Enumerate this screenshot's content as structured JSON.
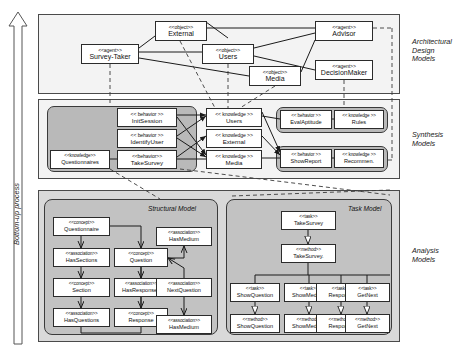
{
  "process_label": "Bottom-up process",
  "side_captions": [
    {
      "text": "Architectural\nDesign\nModels",
      "x": 412,
      "y": 38
    },
    {
      "text": "Synthesis\nModels",
      "x": 412,
      "y": 131
    },
    {
      "text": "Analysis\nModels",
      "x": 412,
      "y": 247
    }
  ],
  "layers": [
    {
      "name": "architectural-design-models",
      "x": 38,
      "y": 14,
      "w": 362,
      "h": 80
    },
    {
      "name": "synthesis-models",
      "x": 38,
      "y": 99,
      "w": 362,
      "h": 80
    },
    {
      "name": "analysis-models",
      "x": 38,
      "y": 190,
      "w": 362,
      "h": 152
    }
  ],
  "groups": [
    {
      "name": "synthesis-group-left",
      "x": 47,
      "y": 106,
      "w": 150,
      "h": 66
    },
    {
      "name": "synthesis-group-eval",
      "x": 276,
      "y": 107,
      "w": 112,
      "h": 26
    },
    {
      "name": "synthesis-group-report",
      "x": 276,
      "y": 146,
      "w": 112,
      "h": 26
    }
  ],
  "submodels": [
    {
      "name": "structural-model",
      "title": "Structural Model",
      "x": 44,
      "y": 199,
      "w": 174,
      "h": 136,
      "title_x": 148,
      "title_y": 205
    },
    {
      "name": "task-model",
      "title": "Task Model",
      "x": 226,
      "y": 199,
      "w": 166,
      "h": 136,
      "title_x": 348,
      "title_y": 205
    }
  ],
  "architectural_nodes": [
    {
      "name": "node-external",
      "stereotype": "<<object>>",
      "label": "External",
      "x": 155,
      "y": 21,
      "w": 52,
      "h": 20
    },
    {
      "name": "node-survey-taker",
      "stereotype": "<<agent>>",
      "label": "Survey-Taker",
      "x": 81,
      "y": 44,
      "w": 58,
      "h": 20
    },
    {
      "name": "node-users",
      "stereotype": "<<object>>",
      "label": "Users",
      "x": 202,
      "y": 44,
      "w": 52,
      "h": 20
    },
    {
      "name": "node-media",
      "stereotype": "<<object>>",
      "label": "Media",
      "x": 249,
      "y": 66,
      "w": 52,
      "h": 20
    },
    {
      "name": "node-advisor",
      "stereotype": "<<agent>>",
      "label": "Advisor",
      "x": 315,
      "y": 21,
      "w": 58,
      "h": 20
    },
    {
      "name": "node-decisionmaker",
      "stereotype": "<<agent>>",
      "label": "DecisionMaker",
      "x": 315,
      "y": 60,
      "w": 58,
      "h": 20
    }
  ],
  "synthesis_nodes": [
    {
      "name": "node-questionnaires",
      "stereotype": "<<knowledge>>",
      "label": "Questionnaires",
      "x": 50,
      "y": 150,
      "w": 60,
      "h": 19,
      "size": "tiny"
    },
    {
      "name": "node-initsession",
      "stereotype": "<< behavior >>",
      "label": "InitSession",
      "x": 117,
      "y": 108,
      "w": 60,
      "h": 19,
      "size": "small"
    },
    {
      "name": "node-identifyuser",
      "stereotype": "<< behavior >>",
      "label": "IdentifyUser",
      "x": 117,
      "y": 129,
      "w": 60,
      "h": 19,
      "size": "small"
    },
    {
      "name": "node-takesurvey-b",
      "stereotype": "<<behavior>>",
      "label": "TakeSurvey",
      "x": 117,
      "y": 150,
      "w": 60,
      "h": 19,
      "size": "small"
    },
    {
      "name": "node-k-users",
      "stereotype": "<< knowledge >>",
      "label": "Users",
      "x": 206,
      "y": 108,
      "w": 56,
      "h": 19,
      "size": "small"
    },
    {
      "name": "node-k-external",
      "stereotype": "<< knowledge >>",
      "label": "External",
      "x": 206,
      "y": 129,
      "w": 56,
      "h": 19,
      "size": "small"
    },
    {
      "name": "node-k-media",
      "stereotype": "<< knowledge >>",
      "label": "Media",
      "x": 206,
      "y": 150,
      "w": 56,
      "h": 19,
      "size": "small"
    },
    {
      "name": "node-evalaptitude",
      "stereotype": "<< behavior >>",
      "label": "EvalAptitude",
      "x": 280,
      "y": 110,
      "w": 52,
      "h": 19,
      "size": "tiny"
    },
    {
      "name": "node-rules",
      "stereotype": "<< knowledge >>",
      "label": "Rules",
      "x": 334,
      "y": 110,
      "w": 50,
      "h": 19,
      "size": "tiny"
    },
    {
      "name": "node-showreport",
      "stereotype": "<< behavior >>",
      "label": "ShowReport",
      "x": 280,
      "y": 149,
      "w": 52,
      "h": 19,
      "size": "tiny"
    },
    {
      "name": "node-recommen",
      "stereotype": "<< knowledge >>",
      "label": "Recommen.",
      "x": 334,
      "y": 149,
      "w": 50,
      "h": 19,
      "size": "tiny"
    }
  ],
  "structural_nodes": [
    {
      "name": "node-questionnaire",
      "stereotype": "<<concept>>",
      "label": "Questionnaire",
      "x": 53,
      "y": 217,
      "w": 57,
      "h": 19,
      "size": "tiny"
    },
    {
      "name": "node-hassections",
      "stereotype": "<<association>>",
      "label": "HasSections",
      "x": 53,
      "y": 248,
      "w": 57,
      "h": 19,
      "size": "tiny"
    },
    {
      "name": "node-section",
      "stereotype": "<<concept>>",
      "label": "Section",
      "x": 53,
      "y": 278,
      "w": 57,
      "h": 19,
      "size": "tiny"
    },
    {
      "name": "node-hasquestions",
      "stereotype": "<<association>>",
      "label": "HasQuestions",
      "x": 53,
      "y": 308,
      "w": 57,
      "h": 19,
      "size": "tiny"
    },
    {
      "name": "node-question",
      "stereotype": "<<concept>>",
      "label": "Question",
      "x": 114,
      "y": 248,
      "w": 54,
      "h": 19,
      "size": "tiny"
    },
    {
      "name": "node-hasresponses",
      "stereotype": "<<association>>",
      "label": "HasResponses",
      "x": 114,
      "y": 278,
      "w": 54,
      "h": 19,
      "size": "tiny"
    },
    {
      "name": "node-response-s",
      "stereotype": "<<concept>>",
      "label": "Response",
      "x": 114,
      "y": 308,
      "w": 54,
      "h": 19,
      "size": "tiny"
    },
    {
      "name": "node-hasmedium-top",
      "stereotype": "<<association>>",
      "label": "HasMedium",
      "x": 156,
      "y": 227,
      "w": 56,
      "h": 19,
      "size": "tiny"
    },
    {
      "name": "node-nextquestion",
      "stereotype": "<<association>>",
      "label": "NextQuestion",
      "x": 156,
      "y": 278,
      "w": 56,
      "h": 19,
      "size": "tiny"
    },
    {
      "name": "node-hasmedium-bot",
      "stereotype": "<<association>>",
      "label": "HasMedium",
      "x": 156,
      "y": 315,
      "w": 56,
      "h": 19,
      "size": "tiny"
    }
  ],
  "task_nodes": [
    {
      "name": "node-task-takesurvey",
      "stereotype": "<<task>>",
      "label": "TakeSurvey",
      "x": 281,
      "y": 211,
      "w": 55,
      "h": 19,
      "size": "tiny"
    },
    {
      "name": "node-method-takesurvey",
      "stereotype": "<<method>>",
      "label": "TakeSurvey.",
      "x": 281,
      "y": 244,
      "w": 55,
      "h": 19,
      "size": "tiny"
    },
    {
      "name": "node-task-showquestion",
      "stereotype": "<<task>>",
      "label": "ShowQuestion",
      "x": 230,
      "y": 283,
      "w": 50,
      "h": 19,
      "size": "tiny"
    },
    {
      "name": "node-task-showmedium",
      "stereotype": "<<task>>",
      "label": "ShowMedium",
      "x": 284,
      "y": 283,
      "w": 50,
      "h": 19,
      "size": "tiny"
    },
    {
      "name": "node-task-response",
      "stereotype": "<<task>>",
      "label": "Response",
      "x": 316,
      "y": 283,
      "w": 50,
      "h": 19,
      "size": "tiny"
    },
    {
      "name": "node-task-getnext",
      "stereotype": "<<task>>",
      "label": "GetNext",
      "x": 345,
      "y": 283,
      "w": 45,
      "h": 19,
      "size": "tiny"
    },
    {
      "name": "node-method-showquestion",
      "stereotype": "<<method>>",
      "label": "ShowQuestion",
      "x": 230,
      "y": 314,
      "w": 50,
      "h": 19,
      "size": "tiny"
    },
    {
      "name": "node-method-showmedium",
      "stereotype": "<<method>>",
      "label": "ShowMedium",
      "x": 284,
      "y": 314,
      "w": 50,
      "h": 19,
      "size": "tiny"
    },
    {
      "name": "node-method-response",
      "stereotype": "<<method>>",
      "label": "Response",
      "x": 316,
      "y": 314,
      "w": 50,
      "h": 19,
      "size": "tiny"
    },
    {
      "name": "node-method-getnext",
      "stereotype": "<<method>>",
      "label": "GetNext",
      "x": 345,
      "y": 314,
      "w": 45,
      "h": 19,
      "size": "tiny"
    }
  ],
  "colors": {
    "layer_fill": "#f3f3f3",
    "analysis_fill": "#d9d9d9",
    "group_fill": "#b9b9b9",
    "submodel_fill": "#c2c2c2",
    "node_fill": "#ffffff",
    "stroke": "#2b2b2b"
  }
}
